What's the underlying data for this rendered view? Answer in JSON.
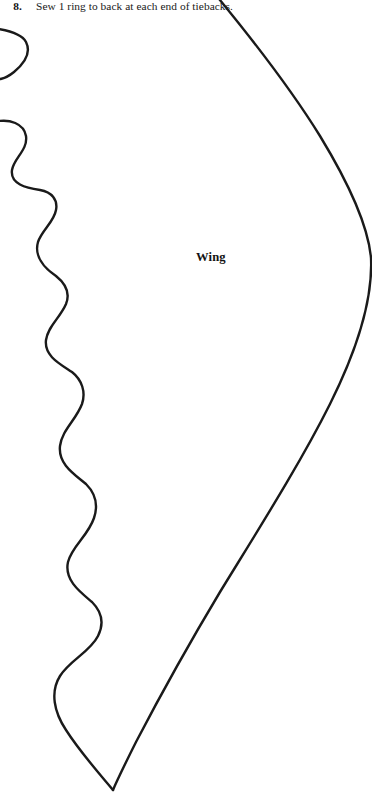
{
  "page": {
    "background_color": "#ffffff",
    "width": 372,
    "height": 797,
    "document_type": "sewing-pattern-template"
  },
  "instruction": {
    "number": "8.",
    "text": "Sew 1 ring to back at each end of tiebacks."
  },
  "pattern": {
    "label": "Wing",
    "stroke_color": "#1a1a1a",
    "stroke_width": 2.4,
    "fill": "none",
    "description": "Wing pattern piece outline: smooth convex right edge and scalloped feather-edge on the left, meeting at a point at the bottom.",
    "outline_right_path": "M 215 -6 C 248 34, 289 86, 320 136 C 348 182, 368 224, 371 258 C 373 300, 356 352, 330 404 C 300 464, 258 530, 220 592 C 190 642, 160 696, 136 742 C 126 762, 118 778, 113 790",
    "outline_left_path": "M -8 28 C 8 30, 22 34, 26 42 C 31 52, 26 62, 14 72 C 4 80, -2 80, -8 78 M -6 122 C 10 118, 24 124, 26 136 C 28 150, 14 158, 12 170 C 10 184, 26 188, 40 190 C 52 192, 58 200, 56 210 C 54 222, 42 230, 38 242 C 34 256, 44 268, 56 276 C 66 284, 70 294, 66 304 C 60 318, 48 326, 46 340 C 44 356, 60 364, 72 372 C 82 380, 86 392, 82 404 C 76 420, 62 430, 60 446 C 58 464, 74 474, 86 484 C 96 494, 98 506, 94 518 C 88 536, 72 546, 68 562 C 64 580, 80 592, 92 602 C 102 612, 104 624, 98 636 C 90 652, 70 660, 60 676 C 50 692, 54 712, 66 730 C 80 752, 98 772, 113 790",
    "tip_point": {
      "x": 113,
      "y": 790
    },
    "rightmost_point": {
      "x": 371,
      "y": 258
    }
  }
}
